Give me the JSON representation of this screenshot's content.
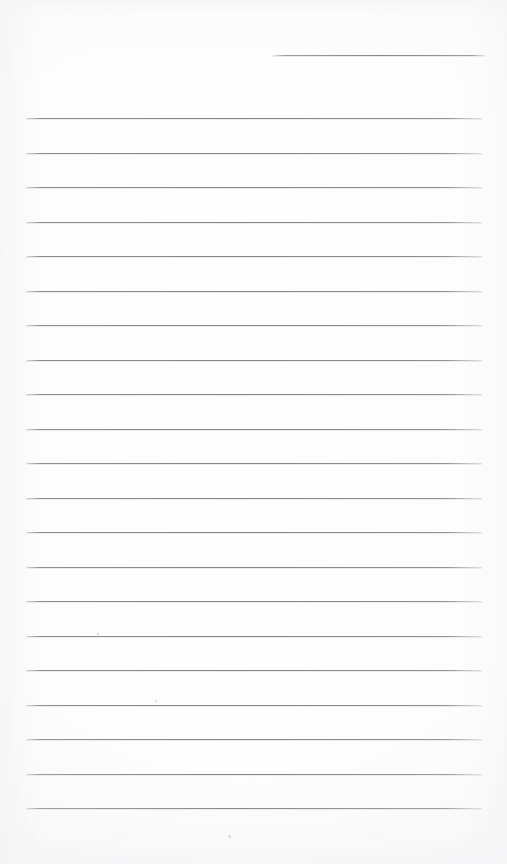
{
  "page": {
    "kind": "blank-lined-notebook-page",
    "width": 507,
    "height": 864,
    "paper_color": "#fdfdfd",
    "rule_color": "#8a8a8d",
    "text_content": "",
    "handwriting": "",
    "title": ""
  },
  "header_rule": {
    "name": "header-rule",
    "x": 272,
    "y": 55,
    "width": 213,
    "thickness": 1
  },
  "ruled_lines": {
    "count": 21,
    "left": 26,
    "right": 482,
    "width": 456,
    "first_y": 118,
    "spacing": 34.5,
    "thickness": 1,
    "y_positions": [
      118,
      152.5,
      187,
      221.5,
      256,
      290.5,
      325,
      359.5,
      394,
      428.5,
      463,
      497.5,
      532,
      566.5,
      601,
      635.5,
      670,
      704.5,
      739,
      773.5,
      808
    ]
  },
  "specks": [
    {
      "x": 97,
      "y": 633,
      "size": 2
    },
    {
      "x": 155,
      "y": 700,
      "size": 2
    },
    {
      "x": 228,
      "y": 835,
      "size": 3
    }
  ]
}
